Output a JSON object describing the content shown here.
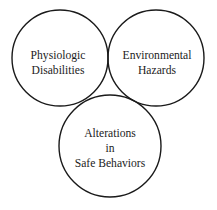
{
  "diagram": {
    "type": "venn",
    "background_color": "#ffffff",
    "stroke_color": "#1a1a1a",
    "text_color": "#1c1c1c",
    "intersection_fill": "#000000",
    "sets": [
      {
        "id": "physiologic-disabilities",
        "label_lines": [
          "Physiologic",
          "Disabilities"
        ],
        "line1": "Physiologic",
        "line2": "Disabilities",
        "position": "top-left",
        "cx": 60,
        "cy": 58,
        "r": 48
      },
      {
        "id": "environmental-hazards",
        "label_lines": [
          "Environmental",
          "Hazards"
        ],
        "line1": "Environmental",
        "line2": "Hazards",
        "position": "top-right",
        "cx": 156,
        "cy": 58,
        "r": 48
      },
      {
        "id": "alterations-in-safe-behaviors",
        "label_lines": [
          "Alterations",
          "in",
          "Safe Behaviors"
        ],
        "line1": "Alterations",
        "line2": "in",
        "line3": "Safe Behaviors",
        "position": "bottom-center",
        "cx": 110,
        "cy": 146,
        "r": 51
      }
    ],
    "intersection": {
      "id": "triple-overlap",
      "label": "",
      "filled": true,
      "color": "#000000"
    }
  }
}
